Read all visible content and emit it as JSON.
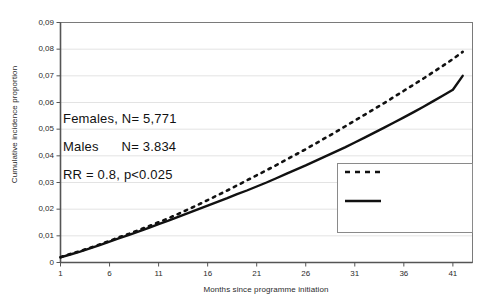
{
  "chart_data": {
    "type": "line",
    "title": "",
    "xlabel": "Months since programme initiation",
    "ylabel": "Cumulative incidence proportion",
    "xlim": [
      1,
      43
    ],
    "ylim": [
      0,
      0.09
    ],
    "grid": true,
    "legend_position": "bottom-right",
    "x_tick_labels": [
      "1",
      "6",
      "11",
      "16",
      "21",
      "26",
      "31",
      "36",
      "41"
    ],
    "x_tick_values": [
      1,
      6,
      11,
      16,
      21,
      26,
      31,
      36,
      41
    ],
    "y_tick_labels": [
      "0",
      "0,01",
      "0,02",
      "0,03",
      "0,04",
      "0,05",
      "0,06",
      "0,07",
      "0,08",
      "0,09"
    ],
    "y_tick_values": [
      0,
      0.01,
      0.02,
      0.03,
      0.04,
      0.05,
      0.06,
      0.07,
      0.08,
      0.09
    ],
    "x": [
      1,
      2,
      3,
      4,
      5,
      6,
      7,
      8,
      9,
      10,
      11,
      12,
      13,
      14,
      15,
      16,
      17,
      18,
      19,
      20,
      21,
      22,
      23,
      24,
      25,
      26,
      27,
      28,
      29,
      30,
      31,
      32,
      33,
      34,
      35,
      36,
      37,
      38,
      39,
      40,
      41,
      42
    ],
    "series": [
      {
        "name": "Other residents",
        "style": "dashed",
        "color": "#111111",
        "values": [
          0.002,
          0.0032,
          0.0043,
          0.0055,
          0.0068,
          0.0081,
          0.0095,
          0.0108,
          0.0122,
          0.0136,
          0.0151,
          0.0166,
          0.0182,
          0.0199,
          0.0216,
          0.0234,
          0.0252,
          0.027,
          0.0289,
          0.0308,
          0.0327,
          0.0346,
          0.0365,
          0.0385,
          0.0405,
          0.0425,
          0.0446,
          0.0467,
          0.0488,
          0.051,
          0.0532,
          0.0554,
          0.0576,
          0.0598,
          0.0621,
          0.0644,
          0.0667,
          0.069,
          0.0714,
          0.0738,
          0.0763,
          0.079
        ]
      },
      {
        "name": "Residents offered the Calcium & Vitamin D Program",
        "style": "solid",
        "color": "#111111",
        "values": [
          0.0019,
          0.003,
          0.0041,
          0.0053,
          0.0065,
          0.0078,
          0.0091,
          0.0104,
          0.0117,
          0.013,
          0.0144,
          0.0157,
          0.0171,
          0.0185,
          0.0199,
          0.0213,
          0.0227,
          0.0241,
          0.0256,
          0.027,
          0.0285,
          0.03,
          0.0316,
          0.0332,
          0.0348,
          0.0364,
          0.0381,
          0.0398,
          0.0415,
          0.0432,
          0.045,
          0.0468,
          0.0487,
          0.0506,
          0.0525,
          0.0544,
          0.0564,
          0.0584,
          0.0605,
          0.0626,
          0.0648,
          0.07
        ]
      }
    ],
    "annotations": [
      "Females, N= 5,771",
      "Males      N= 3.834",
      "RR = 0.8, p<0.025"
    ]
  },
  "legend": {
    "items": [
      {
        "label": "Other residents",
        "style": "dashed"
      },
      {
        "label": "Residents offered the\nCalcium & Vitamin D\nProgram",
        "style": "solid"
      }
    ]
  }
}
